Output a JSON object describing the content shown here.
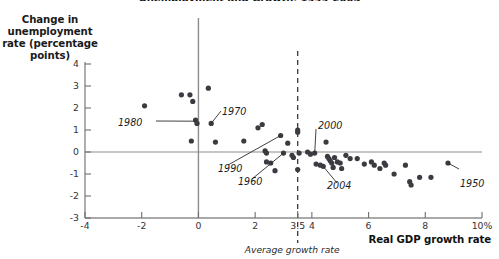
{
  "figure": {
    "title_clipped": "Unemployment and Growth, 1949-2005",
    "yaxis_label": "Change in\nunemployment\nrate (percentage\npoints)",
    "xaxis_label": "Real GDP growth rate",
    "average_note": "Average growth rate"
  },
  "chart_data": {
    "type": "scatter",
    "title": "Unemployment and Growth, 1949-2005",
    "xlabel": "Real GDP growth rate",
    "ylabel": "Change in unemployment rate (percentage points)",
    "xlim": [
      -4,
      10
    ],
    "ylim": [
      -3,
      4
    ],
    "xticks": [
      "-4",
      "-2",
      "0",
      "2",
      "3.5",
      "4",
      "6",
      "8",
      "10%"
    ],
    "xtick_values": [
      -4,
      -2,
      0,
      2,
      3.5,
      4,
      6,
      8,
      10
    ],
    "yticks": [
      "4",
      "3",
      "2",
      "1",
      "0",
      "-1",
      "-2",
      "-3"
    ],
    "ytick_values": [
      4,
      3,
      2,
      1,
      0,
      -1,
      -2,
      -3
    ],
    "grid": false,
    "legend": null,
    "reference_lines": [
      {
        "name": "zero-change-line",
        "axis": "y",
        "value": 0,
        "style": "solid"
      },
      {
        "name": "y-axis-line",
        "axis": "x",
        "value": 0,
        "style": "solid"
      },
      {
        "name": "average-growth-rate-line",
        "axis": "x",
        "value": 3.5,
        "style": "dashed",
        "label": "Average growth rate"
      }
    ],
    "points": [
      {
        "x": -1.9,
        "y": 2.1
      },
      {
        "x": -0.6,
        "y": 2.6
      },
      {
        "x": -0.3,
        "y": 2.6
      },
      {
        "x": -0.2,
        "y": 2.3
      },
      {
        "x": -0.1,
        "y": 1.45
      },
      {
        "x": -0.05,
        "y": 1.3
      },
      {
        "x": -0.25,
        "y": 0.5
      },
      {
        "x": 0.35,
        "y": 2.9
      },
      {
        "x": 0.45,
        "y": 1.3
      },
      {
        "x": 0.6,
        "y": 0.45
      },
      {
        "x": 1.6,
        "y": 0.5
      },
      {
        "x": 2.1,
        "y": 1.1
      },
      {
        "x": 2.25,
        "y": 1.25
      },
      {
        "x": 2.35,
        "y": 0.05
      },
      {
        "x": 2.4,
        "y": -0.05
      },
      {
        "x": 2.4,
        "y": -0.45
      },
      {
        "x": 2.55,
        "y": -0.5
      },
      {
        "x": 2.7,
        "y": -0.85
      },
      {
        "x": 2.9,
        "y": 0.75
      },
      {
        "x": 3.0,
        "y": -0.05
      },
      {
        "x": 3.15,
        "y": 0.4
      },
      {
        "x": 3.3,
        "y": -0.15
      },
      {
        "x": 3.35,
        "y": -0.25
      },
      {
        "x": 3.5,
        "y": 1.0
      },
      {
        "x": 3.5,
        "y": 0.9
      },
      {
        "x": 3.55,
        "y": -0.05
      },
      {
        "x": 3.5,
        "y": -0.8
      },
      {
        "x": 3.85,
        "y": 0.0
      },
      {
        "x": 3.95,
        "y": -0.1
      },
      {
        "x": 4.1,
        "y": -0.05
      },
      {
        "x": 4.15,
        "y": -0.55
      },
      {
        "x": 4.3,
        "y": -0.6
      },
      {
        "x": 4.4,
        "y": -0.65
      },
      {
        "x": 4.5,
        "y": 0.45
      },
      {
        "x": 4.55,
        "y": -0.2
      },
      {
        "x": 4.6,
        "y": -0.3
      },
      {
        "x": 4.65,
        "y": -0.4
      },
      {
        "x": 4.7,
        "y": -0.5
      },
      {
        "x": 4.75,
        "y": -0.7
      },
      {
        "x": 4.8,
        "y": -0.25
      },
      {
        "x": 4.9,
        "y": -0.45
      },
      {
        "x": 5.0,
        "y": -0.5
      },
      {
        "x": 5.05,
        "y": -0.75
      },
      {
        "x": 5.2,
        "y": -0.15
      },
      {
        "x": 5.35,
        "y": -0.3
      },
      {
        "x": 5.6,
        "y": -0.3
      },
      {
        "x": 5.85,
        "y": -0.55
      },
      {
        "x": 6.1,
        "y": -0.45
      },
      {
        "x": 6.2,
        "y": -0.6
      },
      {
        "x": 6.4,
        "y": -0.75
      },
      {
        "x": 6.55,
        "y": -0.5
      },
      {
        "x": 6.6,
        "y": -0.6
      },
      {
        "x": 6.9,
        "y": -1.0
      },
      {
        "x": 7.3,
        "y": -0.6
      },
      {
        "x": 7.45,
        "y": -1.35
      },
      {
        "x": 7.5,
        "y": -1.5
      },
      {
        "x": 7.8,
        "y": -1.15
      },
      {
        "x": 8.2,
        "y": -1.15
      },
      {
        "x": 8.8,
        "y": -0.5
      }
    ],
    "annotations": [
      {
        "label": "1980",
        "point": {
          "x": -0.1,
          "y": 1.4
        }
      },
      {
        "label": "1970",
        "point": {
          "x": 0.45,
          "y": 1.3
        }
      },
      {
        "label": "1990",
        "point": {
          "x": 2.9,
          "y": 0.75
        }
      },
      {
        "label": "1960",
        "point": {
          "x": 3.0,
          "y": -0.05
        }
      },
      {
        "label": "2000",
        "point": {
          "x": 4.1,
          "y": -0.05
        }
      },
      {
        "label": "2004",
        "point": {
          "x": 4.4,
          "y": -0.65
        }
      },
      {
        "label": "1950",
        "point": {
          "x": 8.8,
          "y": -0.5
        }
      }
    ]
  }
}
